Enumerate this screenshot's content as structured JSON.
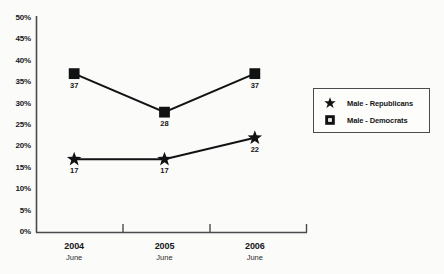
{
  "chart_data": {
    "type": "line",
    "title": "",
    "subtitle": "",
    "xlabel": "",
    "ylabel": "",
    "categories": [
      "2004",
      "2005",
      "2006"
    ],
    "category_sublabels": [
      "June",
      "June",
      "June"
    ],
    "ylim": [
      0,
      50
    ],
    "y_tick_labels": [
      "50%",
      "45%",
      "40%",
      "35%",
      "30%",
      "25%",
      "20%",
      "15%",
      "10%",
      "5%",
      "0%"
    ],
    "y_tick_values": [
      50,
      45,
      40,
      35,
      30,
      25,
      20,
      15,
      10,
      5,
      0
    ],
    "grid": false,
    "legend_position": "right",
    "series": [
      {
        "name": "Male - Republicans",
        "marker": "star",
        "color": "#111214",
        "values": [
          17,
          17,
          22
        ],
        "data_labels": [
          "17",
          "17",
          "22"
        ]
      },
      {
        "name": "Male - Democrats",
        "marker": "square",
        "color": "#111214",
        "values": [
          37,
          28,
          37
        ],
        "data_labels": [
          "37",
          "28",
          "37"
        ]
      }
    ]
  },
  "legend": {
    "items": [
      {
        "label": "Male - Republicans",
        "marker": "star-icon"
      },
      {
        "label": "Male - Democrats",
        "marker": "square-icon"
      }
    ]
  },
  "colors": {
    "line": "#111214",
    "axis": "#4a4b4e",
    "text": "#141517",
    "background": "#fbfbf9"
  }
}
